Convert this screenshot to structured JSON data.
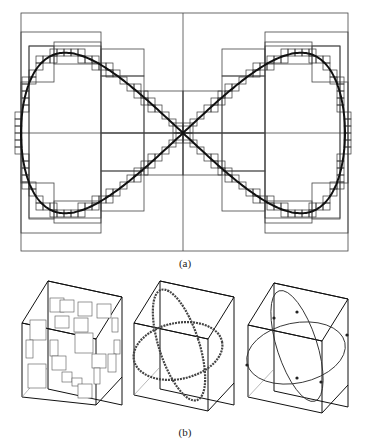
{
  "figure": {
    "panel_a": {
      "caption": "(a)",
      "description": "Figure-eight (lemniscate) curve with hierarchical box subdivision (quadtree-like staircase cells)",
      "frame": {
        "x": 21,
        "y": 13,
        "width": 327,
        "height": 238
      },
      "center": {
        "x": 183,
        "y": 133
      },
      "curve_color": "#111111",
      "box_color": "#444444"
    },
    "panel_b": {
      "caption": "(b)",
      "cubes": [
        {
          "name": "cube-with-boxes",
          "description": "Cube containing scattered subdivision boxes"
        },
        {
          "name": "cube-with-box-chained-ellipses",
          "description": "Cube with two intersecting ellipses covered by small boxes"
        },
        {
          "name": "cube-with-ellipses",
          "description": "Cube with two intersecting ellipses and marked points"
        }
      ]
    }
  }
}
